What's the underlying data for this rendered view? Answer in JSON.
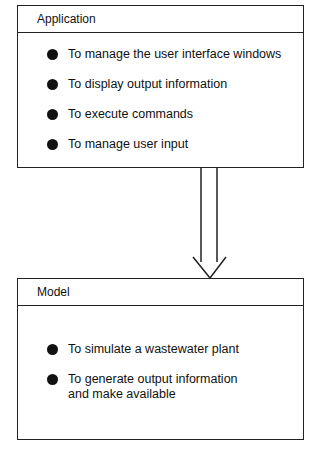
{
  "application": {
    "title": "Application",
    "items": [
      "To manage the user interface windows",
      "To display output information",
      "To execute commands",
      "To manage user input"
    ]
  },
  "model": {
    "title": "Model",
    "items": [
      "To simulate a wastewater plant",
      "To generate output information and make available"
    ]
  },
  "arrow": {
    "direction": "down",
    "from": "Application",
    "to": "Model"
  }
}
